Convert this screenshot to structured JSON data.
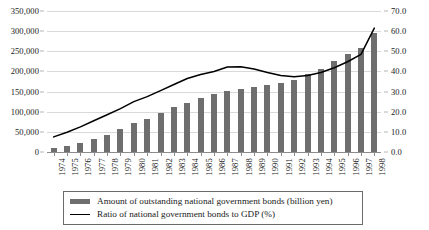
{
  "chart_data": {
    "type": "bar",
    "title": "",
    "subtitle": "",
    "xlabel": "",
    "ylabel": "",
    "y2label": "",
    "grid": true,
    "legend_position": "bottom",
    "categories": [
      "1974",
      "1975",
      "1976",
      "1977",
      "1978",
      "1979",
      "1980",
      "1981",
      "1982",
      "1983",
      "1984",
      "1985",
      "1986",
      "1987",
      "1988",
      "1989",
      "1990",
      "1991",
      "1992",
      "1993",
      "1994",
      "1995",
      "1996",
      "1997",
      "1998"
    ],
    "ylim": [
      0,
      350000
    ],
    "yticks": [
      0,
      50000,
      100000,
      150000,
      200000,
      250000,
      300000,
      350000
    ],
    "ytick_labels": [
      "0",
      "50,000",
      "100,000",
      "150,000",
      "200,000",
      "250,000",
      "300,000",
      "350,000"
    ],
    "y2lim": [
      0,
      70
    ],
    "y2ticks": [
      0,
      10,
      20,
      30,
      40,
      50,
      60,
      70
    ],
    "y2tick_labels": [
      "0.0",
      "10.0",
      "20.0",
      "30.0",
      "40.0",
      "50.0",
      "60.0",
      "70.0"
    ],
    "series": [
      {
        "name": "Amount of outstanding national government bonds (billion yen)",
        "type": "bar",
        "axis": "left",
        "color": "#6e6e6e",
        "values": [
          9000,
          15000,
          22000,
          32000,
          43000,
          56000,
          71000,
          82000,
          96000,
          111000,
          122000,
          134000,
          145000,
          152000,
          157000,
          161000,
          166000,
          172000,
          178000,
          193000,
          207000,
          225000,
          244000,
          258000,
          295000
        ]
      },
      {
        "name": "Ratio of national government bonds to GDP (%)",
        "type": "line",
        "axis": "right",
        "color": "#000000",
        "values": [
          7.5,
          9.8,
          12.5,
          15.5,
          18.5,
          21.5,
          25.0,
          27.5,
          30.5,
          33.5,
          36.5,
          38.5,
          40.0,
          42.2,
          42.3,
          41.2,
          39.5,
          38.0,
          37.3,
          38.0,
          39.5,
          41.8,
          44.8,
          48.5,
          53.0
        ]
      }
    ],
    "final_ratio_value": 61.5
  },
  "legend": {
    "entries": [
      {
        "marker": "bar-swatch",
        "label": "Amount of outstanding national government bonds (billion yen)"
      },
      {
        "marker": "line-swatch",
        "label": "Ratio of national government bonds to GDP (%)"
      }
    ]
  }
}
